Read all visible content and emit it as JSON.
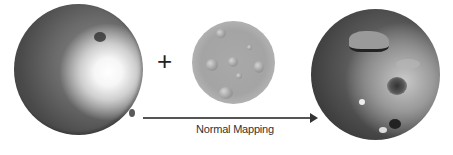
{
  "diagram": {
    "components": [
      {
        "id": "base-sphere",
        "description": "Low-poly grey sphere with lighting highlight"
      },
      {
        "id": "operator",
        "symbol": "+"
      },
      {
        "id": "normal-map",
        "description": "Circular cratered surface texture"
      },
      {
        "id": "result-sphere",
        "description": "Sphere with normal-mapped crater detail"
      }
    ],
    "arrow": {
      "label": "Normal Mapping",
      "direction": "right"
    }
  },
  "labels": {
    "plus": "+",
    "arrow_label": "Normal Mapping"
  },
  "colors": {
    "background": "#ffffff",
    "arrow": "#444444",
    "text": "#333333"
  }
}
